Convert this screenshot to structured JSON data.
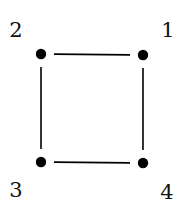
{
  "diagram": {
    "type": "graph",
    "node_color": "#000000",
    "edge_color": "#000000",
    "nodes": [
      {
        "id": "1",
        "label": "1",
        "x": 143,
        "y": 55,
        "label_x": 168,
        "label_y": 37
      },
      {
        "id": "2",
        "label": "2",
        "x": 41,
        "y": 54,
        "label_x": 16,
        "label_y": 37
      },
      {
        "id": "3",
        "label": "3",
        "x": 41,
        "y": 162,
        "label_x": 16,
        "label_y": 197
      },
      {
        "id": "4",
        "label": "4",
        "x": 143,
        "y": 163,
        "label_x": 167,
        "label_y": 199
      }
    ],
    "edges": [
      {
        "from": "2",
        "to": "1"
      },
      {
        "from": "1",
        "to": "4"
      },
      {
        "from": "4",
        "to": "3"
      },
      {
        "from": "3",
        "to": "2"
      }
    ]
  }
}
